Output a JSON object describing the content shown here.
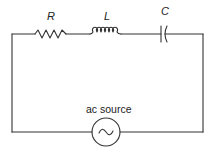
{
  "diagram": {
    "type": "RLC series circuit",
    "components": {
      "resistor": {
        "label": "R"
      },
      "inductor": {
        "label": "L"
      },
      "capacitor": {
        "label": "C"
      },
      "source": {
        "label": "ac source",
        "symbol": "~"
      }
    },
    "colors": {
      "line": "#333333",
      "background": "#ffffff"
    }
  }
}
